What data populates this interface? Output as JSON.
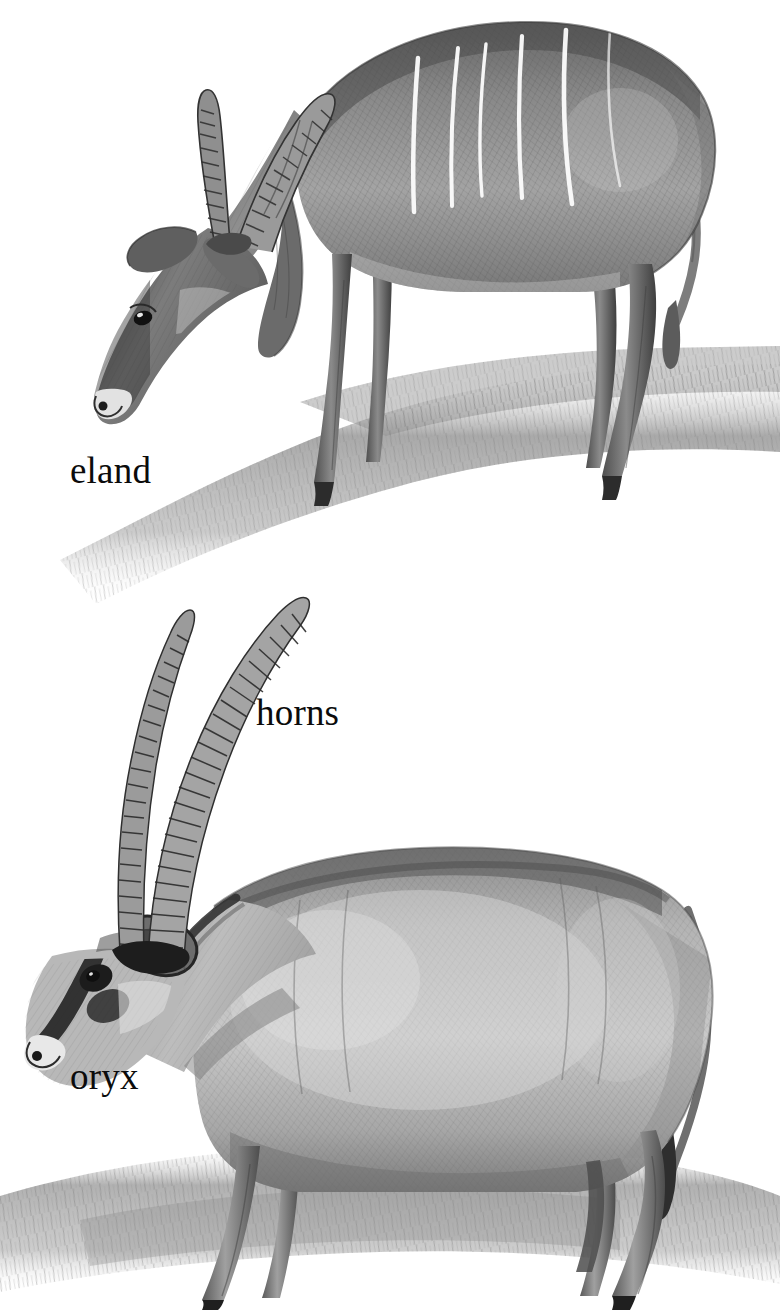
{
  "plate": {
    "title": "eland and oryx",
    "background_color": "#ffffff",
    "ink_color": "#0b0b0b",
    "medium": "grayscale pencil / stipple-engraving illustration",
    "width": 780,
    "height": 1311
  },
  "labels": [
    {
      "id": "eland",
      "text": "eland",
      "x": 70,
      "y": 452
    },
    {
      "id": "horns",
      "text": "horns",
      "x": 256,
      "y": 694
    },
    {
      "id": "oryx",
      "text": "oryx",
      "x": 70,
      "y": 1058
    }
  ],
  "figures": [
    {
      "id": "eland",
      "common_name": "eland",
      "position": "upper",
      "pose": "standing on a grassy rise, head lowered to the left, grazing",
      "facing": "left",
      "features": {
        "horns": "pair of long, straight, tightly spiralled (ridged) horns angled back over the head",
        "ears": "broad, rounded ears held low at the sides of the head",
        "body": "heavy ox-like body with high shoulder hump",
        "markings": "five to six pale vertical stripes across the flank and barrel",
        "tail": "long, tufted tail hanging at the rump",
        "dewlap": "pendulous throat dewlap under the neck",
        "legs": "four slender dark legs ending in dark hooves"
      },
      "ground": "hatched grassy hillside sloping down to the left"
    },
    {
      "id": "oryx",
      "common_name": "oryx",
      "position": "lower",
      "pose": "standing in profile in tall grass, head turned down to the left",
      "facing": "left",
      "features": {
        "horns": "extremely long, straight, ringed horns sweeping up and back, nearly twice head-and-neck length",
        "ears": "single visible dark-rimmed ear set below the horn bases",
        "face": "bold dark facial blaze and dark cheek patch with a pale muzzle",
        "body": "deep barrel-chested body with pale flanks and darker topline",
        "tail": "long dark tail hanging down the hindquarters",
        "legs": "four sturdy legs with dark shading, standing in grass"
      },
      "ground": "band of hatched tall grass along the bottom of the plate"
    }
  ],
  "colors": {
    "ink": "#0b0b0b",
    "paper": "#ffffff",
    "mid_tone": "#8d8d8d",
    "shadow": "#4a4a4a",
    "light_tone": "#c9c9c9"
  }
}
